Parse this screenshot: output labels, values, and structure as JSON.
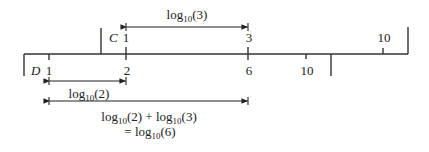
{
  "diagram": {
    "type": "slide-rule-multiplication",
    "scales": {
      "C": {
        "name": "C",
        "ticks": [
          {
            "label": "1",
            "x": 126
          },
          {
            "label": "3",
            "x": 248
          },
          {
            "label": "10",
            "x": 383
          }
        ]
      },
      "D": {
        "name": "D",
        "ticks": [
          {
            "label": "1",
            "x": 49
          },
          {
            "label": "2",
            "x": 126
          },
          {
            "label": "6",
            "x": 248
          },
          {
            "label": "10",
            "x": 306
          }
        ]
      }
    },
    "arrows": [
      {
        "id": "log3",
        "base": "log",
        "sub": "10",
        "arg": "(3)",
        "from": "C1",
        "to": "C3"
      },
      {
        "id": "log2",
        "base": "log",
        "sub": "10",
        "arg": "(2)",
        "from": "D1",
        "to": "D2"
      },
      {
        "id": "sum",
        "from": "D1",
        "to": "D6",
        "line1": {
          "a_base": "log",
          "a_sub": "10",
          "a_arg": "(2)",
          "op": " + ",
          "b_base": "log",
          "b_sub": "10",
          "b_arg": "(3)"
        },
        "line2": {
          "eq": "= ",
          "base": "log",
          "sub": "10",
          "arg": "(6)"
        }
      }
    ]
  }
}
